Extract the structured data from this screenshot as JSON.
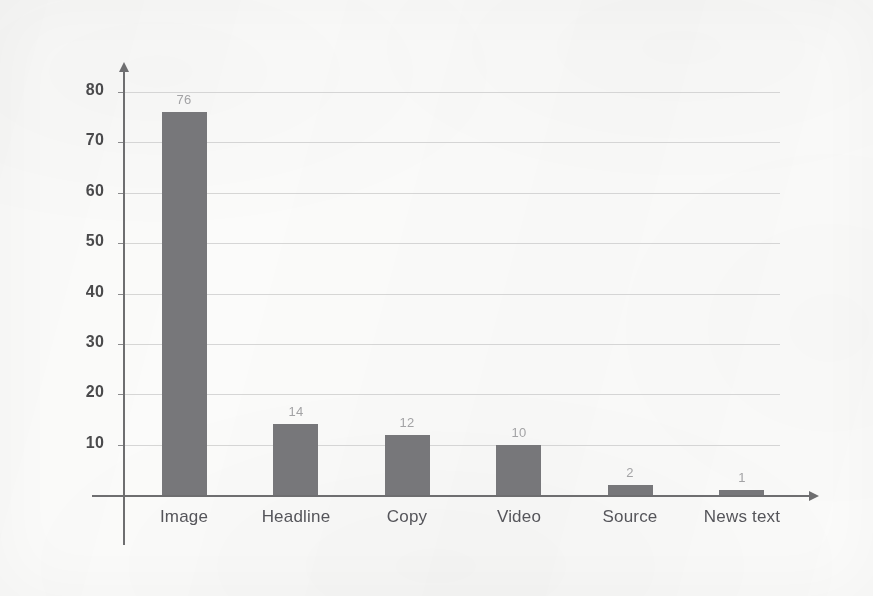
{
  "chart_data": {
    "type": "bar",
    "title": "",
    "subtitle": "",
    "xlabel": "",
    "ylabel": "",
    "categories": [
      "Image",
      "Headline",
      "Copy",
      "Video",
      "Source",
      "News text"
    ],
    "values": [
      76,
      14,
      12,
      10,
      2,
      1
    ],
    "value_labels": [
      "76",
      "14",
      "12",
      "10",
      "2",
      "1"
    ],
    "ylim": [
      0,
      80
    ],
    "ytick_labels": [
      "10",
      "20",
      "30",
      "40",
      "50",
      "60",
      "70",
      "80"
    ],
    "ytick_values": [
      10,
      20,
      30,
      40,
      50,
      60,
      70,
      80
    ],
    "ytick_step": 10,
    "grid": true,
    "legend": null,
    "legend_position": "none",
    "annotations": [],
    "colors": {
      "bar": "#77777a",
      "gridline": "#cfcfcf",
      "axis": "#6e6e70",
      "tick_label": "#4a4a4c",
      "value_label": "#a3a3a5",
      "category_label": "#55555a",
      "background": "#fbfbfa"
    }
  }
}
